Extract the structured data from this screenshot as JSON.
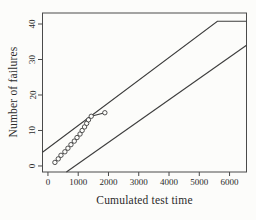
{
  "figure": {
    "background": "#fcfcfa",
    "line_color": "#3d3d3d",
    "box_color": "#4a4a4a",
    "text_color": "#2b2b2b"
  },
  "chart_data": {
    "type": "line",
    "title": "",
    "xlabel": "Cumulated test time",
    "ylabel": "Number of failures",
    "xlim": [
      -180,
      6560
    ],
    "ylim": [
      -1.7,
      43.1
    ],
    "x_ticks": [
      0,
      1000,
      2000,
      3000,
      4000,
      5000,
      6000
    ],
    "y_ticks": [
      0,
      10,
      20,
      30,
      40
    ],
    "grid": false,
    "legend_position": "none",
    "series": [
      {
        "name": "upper-decision-boundary",
        "marker": "none",
        "description": "reject boundary: rises from about (0,5) to (5600,41) then horizontal at 41 to plot edge",
        "points": [
          [
            -180,
            3.85
          ],
          [
            5600,
            40.8
          ],
          [
            6560,
            40.8
          ]
        ]
      },
      {
        "name": "lower-decision-boundary",
        "marker": "none",
        "description": "accept boundary: enters at bottom near x=600 and rises to about (6560,34)",
        "points": [
          [
            610,
            -1.7
          ],
          [
            6560,
            34
          ]
        ]
      },
      {
        "name": "observed-failures",
        "marker": "circle-open",
        "description": "staircase of cumulative failures vs cumulated test time",
        "points": [
          [
            230,
            1
          ],
          [
            340,
            2
          ],
          [
            430,
            3
          ],
          [
            560,
            4
          ],
          [
            660,
            5
          ],
          [
            760,
            6
          ],
          [
            870,
            7
          ],
          [
            960,
            8
          ],
          [
            1060,
            9
          ],
          [
            1130,
            10
          ],
          [
            1210,
            11
          ],
          [
            1280,
            12
          ],
          [
            1340,
            13
          ],
          [
            1430,
            14
          ],
          [
            1880,
            15
          ]
        ]
      }
    ]
  }
}
